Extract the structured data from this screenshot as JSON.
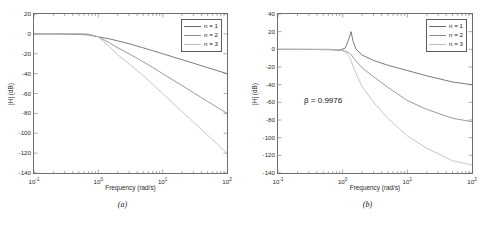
{
  "figure": {
    "background": "#ffffff",
    "panels": [
      {
        "caption": "(a)",
        "chart_key": "plot_a"
      },
      {
        "caption": "(b)",
        "chart_key": "plot_b"
      }
    ]
  },
  "chart_data": [
    {
      "id": "plot_a",
      "type": "line",
      "title": "",
      "xlabel": "Frequency (rad/s)",
      "ylabel": "|H| (dB)",
      "xscale": "log",
      "xlim": [
        0.1,
        100
      ],
      "ylim": [
        -140,
        20
      ],
      "yticks": [
        20,
        0,
        -20,
        -40,
        -60,
        -80,
        -100,
        -120,
        -140
      ],
      "ytick_labels": [
        "20",
        "0",
        "-20",
        "-40",
        "-60",
        "-80",
        "-100",
        "-120",
        "-140"
      ],
      "xticks": [
        0.1,
        1,
        10,
        100
      ],
      "xtick_labels": [
        "10",
        "10",
        "10",
        "10"
      ],
      "xtick_exponents": [
        "-1",
        "0",
        "1",
        "2"
      ],
      "grid": false,
      "legend_position": "upper right",
      "series": [
        {
          "name": "n = 1",
          "color": "#6a6a6a",
          "x": [
            0.1,
            0.2,
            0.3,
            0.5,
            0.7,
            1.0,
            1.5,
            2.0,
            3.0,
            5.0,
            7.0,
            10.0,
            20.0,
            30.0,
            50.0,
            70.0,
            100.0
          ],
          "y": [
            0.0,
            -0.1,
            -0.2,
            -0.5,
            -1.1,
            -3.0,
            -5.1,
            -7.0,
            -9.9,
            -14.1,
            -16.9,
            -20.0,
            -26.0,
            -29.5,
            -34.0,
            -36.9,
            -40.0
          ]
        },
        {
          "name": "n = 2",
          "color": "#8d8d8d",
          "x": [
            0.1,
            0.2,
            0.3,
            0.5,
            0.7,
            1.0,
            1.5,
            2.0,
            3.0,
            5.0,
            7.0,
            10.0,
            20.0,
            30.0,
            50.0,
            70.0,
            100.0
          ],
          "y": [
            0.0,
            0.0,
            0.0,
            -0.1,
            -0.4,
            -3.0,
            -9.1,
            -14.0,
            -20.0,
            -28.1,
            -33.8,
            -40.0,
            -52.0,
            -59.1,
            -68.0,
            -73.8,
            -80.0
          ]
        },
        {
          "name": "n = 3",
          "color": "#bfbfbf",
          "x": [
            0.1,
            0.2,
            0.3,
            0.5,
            0.7,
            1.0,
            1.5,
            2.0,
            3.0,
            5.0,
            7.0,
            10.0,
            20.0,
            30.0,
            50.0,
            70.0,
            100.0
          ],
          "y": [
            0.0,
            0.0,
            0.0,
            0.0,
            -0.1,
            -3.0,
            -13.0,
            -21.1,
            -30.0,
            -42.0,
            -50.7,
            -60.0,
            -78.1,
            -88.6,
            -102.0,
            -110.7,
            -120.0
          ]
        }
      ]
    },
    {
      "id": "plot_b",
      "type": "line",
      "title": "",
      "xlabel": "Frequency (rad/s)",
      "ylabel": "|H| (dB)",
      "xscale": "log",
      "xlim": [
        0.1,
        100
      ],
      "ylim": [
        -140,
        40
      ],
      "yticks": [
        40,
        20,
        0,
        -20,
        -40,
        -60,
        -80,
        -100,
        -120,
        -140
      ],
      "ytick_labels": [
        "40",
        "20",
        "0",
        "-20",
        "-40",
        "-60",
        "-80",
        "-100",
        "-120",
        "-140"
      ],
      "xticks": [
        0.1,
        1,
        10,
        100
      ],
      "xtick_labels": [
        "10",
        "10",
        "10",
        "10"
      ],
      "xtick_exponents": [
        "-1",
        "0",
        "1",
        "2"
      ],
      "grid": false,
      "legend_position": "upper right",
      "annotation": "β = 0.9976",
      "series": [
        {
          "name": "n = 1",
          "color": "#6a6a6a",
          "x": [
            0.1,
            0.3,
            0.6,
            0.9,
            1.1,
            1.25,
            1.35,
            1.45,
            1.6,
            2.0,
            3.0,
            5.0,
            10.0,
            20.0,
            50.0,
            100.0
          ],
          "y": [
            0.0,
            -0.1,
            -0.4,
            -1.0,
            1.5,
            12.0,
            20.0,
            9.0,
            0.5,
            -6.5,
            -12.5,
            -18.0,
            -24.0,
            -30.0,
            -37.0,
            -40.0
          ]
        },
        {
          "name": "n = 2",
          "color": "#8d8d8d",
          "x": [
            0.1,
            0.3,
            0.6,
            0.9,
            1.1,
            1.25,
            1.35,
            1.45,
            1.6,
            2.0,
            3.0,
            5.0,
            10.0,
            20.0,
            50.0,
            100.0
          ],
          "y": [
            0.0,
            0.0,
            -0.1,
            -0.5,
            -2.0,
            -4.0,
            -6.0,
            -9.0,
            -13.0,
            -21.0,
            -31.0,
            -43.0,
            -58.0,
            -68.0,
            -78.0,
            -82.0
          ]
        },
        {
          "name": "n = 3",
          "color": "#bfbfbf",
          "x": [
            0.1,
            0.3,
            0.6,
            0.9,
            1.1,
            1.25,
            1.35,
            1.45,
            1.6,
            2.0,
            3.0,
            5.0,
            10.0,
            20.0,
            50.0,
            100.0
          ],
          "y": [
            0.0,
            0.0,
            0.0,
            -0.3,
            -3.0,
            -8.0,
            -13.0,
            -19.0,
            -27.0,
            -42.0,
            -60.0,
            -78.0,
            -98.0,
            -112.0,
            -126.0,
            -131.0
          ]
        }
      ]
    }
  ]
}
